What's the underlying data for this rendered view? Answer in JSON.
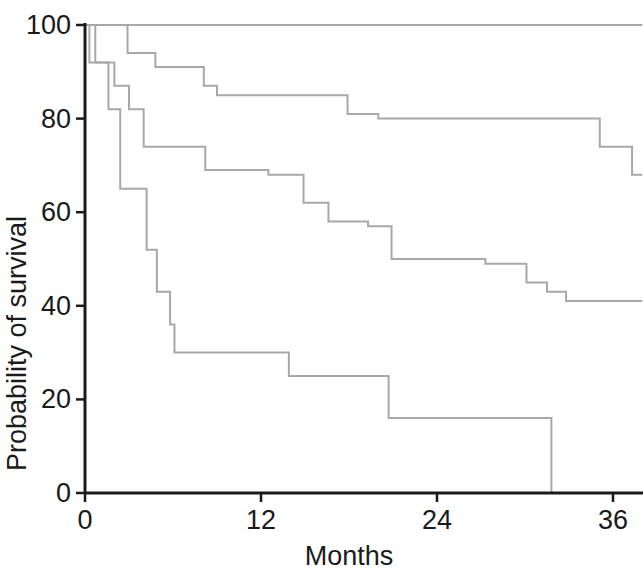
{
  "chart_data": {
    "type": "line",
    "subtype": "kaplan-meier-step",
    "title": "",
    "xlabel": "Months",
    "ylabel": "Probability of survival",
    "xlim": [
      0,
      38
    ],
    "ylim": [
      0,
      100
    ],
    "xticks": [
      0,
      12,
      24,
      36
    ],
    "xtick_labels": [
      "0",
      "12",
      "24",
      "36"
    ],
    "yticks": [
      0,
      20,
      40,
      60,
      80,
      100
    ],
    "ytick_labels": [
      "0",
      "20",
      "40",
      "60",
      "80",
      "100"
    ],
    "grid": false,
    "legend": "none",
    "line_color": "#a8a8a8",
    "axis_color": "#1a1a1a",
    "series": [
      {
        "name": "Curve 1",
        "final_value": 100,
        "steps": [
          {
            "x": 0,
            "y": 100
          },
          {
            "x": 38,
            "y": 100
          }
        ]
      },
      {
        "name": "Curve 2",
        "final_value": 68,
        "steps": [
          {
            "x": 0,
            "y": 100
          },
          {
            "x": 2.9,
            "y": 100
          },
          {
            "x": 2.9,
            "y": 94
          },
          {
            "x": 4.8,
            "y": 94
          },
          {
            "x": 4.8,
            "y": 91
          },
          {
            "x": 8.1,
            "y": 91
          },
          {
            "x": 8.1,
            "y": 87
          },
          {
            "x": 9.0,
            "y": 87
          },
          {
            "x": 9.0,
            "y": 85
          },
          {
            "x": 17.9,
            "y": 85
          },
          {
            "x": 17.9,
            "y": 81
          },
          {
            "x": 20.0,
            "y": 81
          },
          {
            "x": 20.0,
            "y": 80
          },
          {
            "x": 35.1,
            "y": 80
          },
          {
            "x": 35.1,
            "y": 74
          },
          {
            "x": 37.3,
            "y": 74
          },
          {
            "x": 37.3,
            "y": 68
          },
          {
            "x": 38,
            "y": 68
          }
        ]
      },
      {
        "name": "Curve 3",
        "final_value": 41,
        "steps": [
          {
            "x": 0,
            "y": 100
          },
          {
            "x": 0.7,
            "y": 100
          },
          {
            "x": 0.7,
            "y": 92
          },
          {
            "x": 2.0,
            "y": 92
          },
          {
            "x": 2.0,
            "y": 87
          },
          {
            "x": 3.0,
            "y": 87
          },
          {
            "x": 3.0,
            "y": 82
          },
          {
            "x": 4.0,
            "y": 82
          },
          {
            "x": 4.0,
            "y": 74
          },
          {
            "x": 8.2,
            "y": 74
          },
          {
            "x": 8.2,
            "y": 69
          },
          {
            "x": 12.5,
            "y": 69
          },
          {
            "x": 12.5,
            "y": 68
          },
          {
            "x": 14.9,
            "y": 68
          },
          {
            "x": 14.9,
            "y": 62
          },
          {
            "x": 16.6,
            "y": 62
          },
          {
            "x": 16.6,
            "y": 58
          },
          {
            "x": 19.3,
            "y": 58
          },
          {
            "x": 19.3,
            "y": 57
          },
          {
            "x": 20.9,
            "y": 57
          },
          {
            "x": 20.9,
            "y": 50
          },
          {
            "x": 27.3,
            "y": 50
          },
          {
            "x": 27.3,
            "y": 49
          },
          {
            "x": 30.1,
            "y": 49
          },
          {
            "x": 30.1,
            "y": 45
          },
          {
            "x": 31.5,
            "y": 45
          },
          {
            "x": 31.5,
            "y": 43
          },
          {
            "x": 32.8,
            "y": 43
          },
          {
            "x": 32.8,
            "y": 41
          },
          {
            "x": 38,
            "y": 41
          }
        ]
      },
      {
        "name": "Curve 4",
        "final_value": 0,
        "steps": [
          {
            "x": 0,
            "y": 100
          },
          {
            "x": 0.3,
            "y": 100
          },
          {
            "x": 0.3,
            "y": 92
          },
          {
            "x": 1.6,
            "y": 92
          },
          {
            "x": 1.6,
            "y": 82
          },
          {
            "x": 2.4,
            "y": 82
          },
          {
            "x": 2.4,
            "y": 65
          },
          {
            "x": 4.2,
            "y": 65
          },
          {
            "x": 4.2,
            "y": 52
          },
          {
            "x": 4.9,
            "y": 52
          },
          {
            "x": 4.9,
            "y": 43
          },
          {
            "x": 5.8,
            "y": 43
          },
          {
            "x": 5.8,
            "y": 36
          },
          {
            "x": 6.1,
            "y": 36
          },
          {
            "x": 6.1,
            "y": 30
          },
          {
            "x": 13.9,
            "y": 30
          },
          {
            "x": 13.9,
            "y": 25
          },
          {
            "x": 20.7,
            "y": 25
          },
          {
            "x": 20.7,
            "y": 16
          },
          {
            "x": 31.8,
            "y": 16
          },
          {
            "x": 31.8,
            "y": 0
          }
        ]
      }
    ]
  },
  "axes": {
    "x_axis_label": "Months",
    "y_axis_label": "Probability of survival"
  }
}
